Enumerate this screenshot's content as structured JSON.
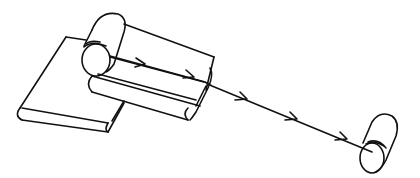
{
  "figure": {
    "type": "line-drawing",
    "colors": {
      "stroke": "#111111",
      "background": "#ffffff"
    },
    "components": [
      {
        "id": "supply-roll",
        "label": ""
      },
      {
        "id": "lower-plate",
        "label": ""
      },
      {
        "id": "upper-plate",
        "label": ""
      },
      {
        "id": "middle-bar",
        "label": ""
      },
      {
        "id": "web-path",
        "label": "",
        "arrow_count": 5
      },
      {
        "id": "take-up-roll",
        "label": ""
      }
    ]
  }
}
